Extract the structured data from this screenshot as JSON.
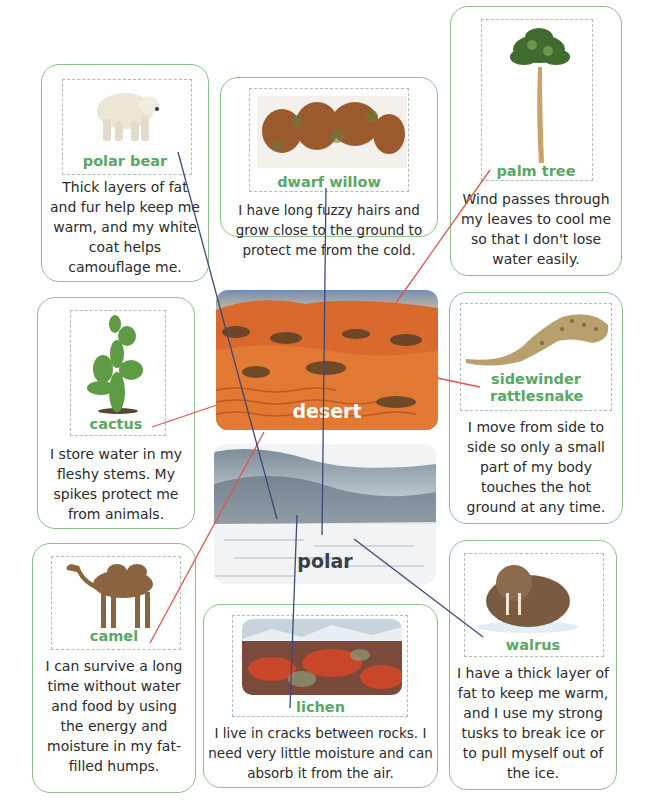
{
  "habitats": {
    "desert": {
      "label": "desert",
      "color": "#d8632a"
    },
    "polar": {
      "label": "polar",
      "color": "#3d4658"
    }
  },
  "cards": {
    "polar_bear": {
      "label": "polar bear",
      "text": "Thick layers of fat and fur help keep me warm, and my white coat helps camouflage me.",
      "habitat": "polar"
    },
    "dwarf_willow": {
      "label": "dwarf willow",
      "text": "I have long fuzzy hairs and grow close to the ground to protect me from the cold.",
      "habitat": "polar"
    },
    "palm_tree": {
      "label": "palm tree",
      "text": "Wind passes through my leaves to cool me so that I don't lose water easily.",
      "habitat": "desert"
    },
    "cactus": {
      "label": "cactus",
      "text": "I store water in my fleshy stems. My spikes protect me from animals.",
      "habitat": "desert"
    },
    "sidewinder": {
      "label": "sidewinder rattlesnake",
      "text": "I move from side to side so only a small part of my body touches the hot ground at any time.",
      "habitat": "desert"
    },
    "camel": {
      "label": "camel",
      "text": "I can survive a long time without water and food by using the energy and moisture in my fat-filled humps.",
      "habitat": "desert"
    },
    "lichen": {
      "label": "lichen",
      "text": "I live in cracks between rocks. I need very little moisture and can absorb it from the air.",
      "habitat": "polar"
    },
    "walrus": {
      "label": "walrus",
      "text": "I have a thick layer of fat to keep me warm, and I use my strong tusks to break ice or to pull myself out of the ice.",
      "habitat": "polar"
    }
  },
  "colors": {
    "card_border": "#8cc08c",
    "label_green": "#5aa863",
    "desert_line": "#e0564f",
    "polar_line": "#3b4a7a"
  }
}
